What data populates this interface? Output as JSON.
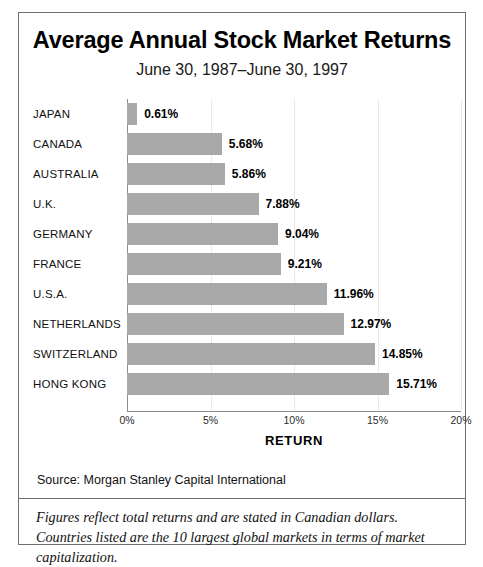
{
  "figure": {
    "title": "Average Annual Stock Market Returns",
    "subtitle": "June 30, 1987–June 30, 1997",
    "source_label": "Source:  Morgan Stanley Capital International",
    "footnote": "Figures reflect total returns and are stated in Canadian dollars. Countries listed are the 10 largest global markets in terms of market capitalization.",
    "bar_color": "#a9a9a9",
    "axis_color": "#8c8c8c",
    "grid_color": "#e9e9e9",
    "frame_color": "#6e6e6e"
  },
  "chart_data": {
    "type": "bar",
    "orientation": "horizontal",
    "title": "Average Annual Stock Market Returns",
    "subtitle": "June 30, 1987–June 30, 1997",
    "xlabel": "RETURN",
    "ylabel": "",
    "xlim": [
      0,
      20
    ],
    "xticks": [
      0,
      5,
      10,
      15,
      20
    ],
    "xtick_labels": [
      "0%",
      "5%",
      "10%",
      "15%",
      "20%"
    ],
    "grid": true,
    "legend": false,
    "value_label_suffix": "%",
    "categories": [
      "JAPAN",
      "CANADA",
      "AUSTRALIA",
      "U.K.",
      "GERMANY",
      "FRANCE",
      "U.S.A.",
      "NETHERLANDS",
      "SWITZERLAND",
      "HONG KONG"
    ],
    "values": [
      0.61,
      5.68,
      5.86,
      7.88,
      9.04,
      9.21,
      11.96,
      12.97,
      14.85,
      15.71
    ],
    "value_labels": [
      "0.61%",
      "5.68%",
      "5.86%",
      "7.88%",
      "9.04%",
      "9.21%",
      "11.96%",
      "12.97%",
      "14.85%",
      "15.71%"
    ],
    "source": "Morgan Stanley Capital International",
    "annotation": "Figures reflect total returns and are stated in Canadian dollars. Countries listed are the 10 largest global markets in terms of market capitalization."
  }
}
